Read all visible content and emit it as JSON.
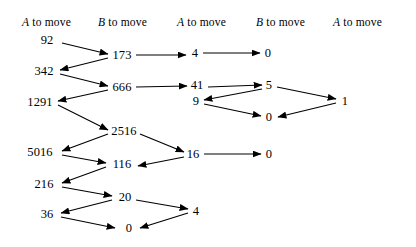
{
  "diagram": {
    "background_color": "#ffffff",
    "ink_color": "#000000",
    "columns": [
      {
        "id": "col1",
        "player": "A",
        "label": "A to move",
        "player_label": "A",
        "rest_label": " to move",
        "x": 22,
        "y": 16
      },
      {
        "id": "col2",
        "player": "B",
        "label": "B to move",
        "player_label": "B",
        "rest_label": " to move",
        "x": 98,
        "y": 16
      },
      {
        "id": "col3",
        "player": "A",
        "label": "A to move",
        "player_label": "A",
        "rest_label": " to move",
        "x": 177,
        "y": 16
      },
      {
        "id": "col4",
        "player": "B",
        "label": "B to move",
        "player_label": "B",
        "rest_label": " to move",
        "x": 256,
        "y": 16
      },
      {
        "id": "col5",
        "player": "A",
        "label": "A to move",
        "player_label": "A",
        "rest_label": " to move",
        "x": 333,
        "y": 16
      }
    ],
    "nodes": [
      {
        "id": "n92",
        "value": "92",
        "column": 1,
        "x": 47,
        "y": 40
      },
      {
        "id": "n342",
        "value": "342",
        "column": 1,
        "x": 44,
        "y": 71
      },
      {
        "id": "n1291",
        "value": "1291",
        "column": 1,
        "x": 40,
        "y": 102
      },
      {
        "id": "n5016",
        "value": "5016",
        "column": 1,
        "x": 40,
        "y": 152
      },
      {
        "id": "n216",
        "value": "216",
        "column": 1,
        "x": 44,
        "y": 184
      },
      {
        "id": "n36",
        "value": "36",
        "column": 1,
        "x": 47,
        "y": 214
      },
      {
        "id": "n173",
        "value": "173",
        "column": 2,
        "x": 122,
        "y": 55
      },
      {
        "id": "n666",
        "value": "666",
        "column": 2,
        "x": 122,
        "y": 87
      },
      {
        "id": "n2516",
        "value": "2516",
        "column": 2,
        "x": 124,
        "y": 131
      },
      {
        "id": "n116",
        "value": "116",
        "column": 2,
        "x": 122,
        "y": 164
      },
      {
        "id": "n20",
        "value": "20",
        "column": 2,
        "x": 125,
        "y": 197
      },
      {
        "id": "n0b",
        "value": "0",
        "column": 2,
        "x": 129,
        "y": 228
      },
      {
        "id": "n4a",
        "value": "4",
        "column": 3,
        "x": 195,
        "y": 53
      },
      {
        "id": "n41",
        "value": "41",
        "column": 3,
        "x": 197,
        "y": 85
      },
      {
        "id": "n9",
        "value": "9",
        "column": 3,
        "x": 196,
        "y": 101
      },
      {
        "id": "n16",
        "value": "16",
        "column": 3,
        "x": 193,
        "y": 154
      },
      {
        "id": "n4b",
        "value": "4",
        "column": 3,
        "x": 196,
        "y": 211
      },
      {
        "id": "n0c",
        "value": "0",
        "column": 4,
        "x": 268,
        "y": 53
      },
      {
        "id": "n5",
        "value": "5",
        "column": 4,
        "x": 269,
        "y": 85
      },
      {
        "id": "n0d",
        "value": "0",
        "column": 4,
        "x": 269,
        "y": 117
      },
      {
        "id": "n0e",
        "value": "0",
        "column": 4,
        "x": 269,
        "y": 154
      },
      {
        "id": "n1",
        "value": "1",
        "column": 5,
        "x": 345,
        "y": 101
      }
    ],
    "edges": [
      {
        "from": "92",
        "to": "173",
        "x1": 62,
        "y1": 43,
        "x2": 108,
        "y2": 54
      },
      {
        "from": "173",
        "to": "342",
        "x1": 108,
        "y1": 58,
        "x2": 60,
        "y2": 70
      },
      {
        "from": "342",
        "to": "666",
        "x1": 60,
        "y1": 74,
        "x2": 108,
        "y2": 86
      },
      {
        "from": "666",
        "to": "1291",
        "x1": 108,
        "y1": 90,
        "x2": 58,
        "y2": 101
      },
      {
        "from": "1291",
        "to": "2516",
        "x1": 58,
        "y1": 105,
        "x2": 108,
        "y2": 130
      },
      {
        "from": "2516",
        "to": "5016",
        "x1": 108,
        "y1": 134,
        "x2": 62,
        "y2": 151
      },
      {
        "from": "5016",
        "to": "116",
        "x1": 62,
        "y1": 155,
        "x2": 106,
        "y2": 163
      },
      {
        "from": "116",
        "to": "216",
        "x1": 106,
        "y1": 167,
        "x2": 62,
        "y2": 183
      },
      {
        "from": "216",
        "to": "20",
        "x1": 62,
        "y1": 187,
        "x2": 112,
        "y2": 196
      },
      {
        "from": "20",
        "to": "36",
        "x1": 112,
        "y1": 200,
        "x2": 61,
        "y2": 213
      },
      {
        "from": "36",
        "to": "0b",
        "x1": 61,
        "y1": 217,
        "x2": 115,
        "y2": 228
      },
      {
        "from": "173",
        "to": "4a",
        "x1": 136,
        "y1": 55,
        "x2": 186,
        "y2": 55
      },
      {
        "from": "4a",
        "to": "0c",
        "x1": 203,
        "y1": 53,
        "x2": 260,
        "y2": 53
      },
      {
        "from": "666",
        "to": "41",
        "x1": 136,
        "y1": 87,
        "x2": 187,
        "y2": 86
      },
      {
        "from": "41",
        "to": "5",
        "x1": 208,
        "y1": 87,
        "x2": 262,
        "y2": 85
      },
      {
        "from": "5",
        "to": "9",
        "x1": 262,
        "y1": 89,
        "x2": 204,
        "y2": 100
      },
      {
        "from": "9",
        "to": "0d",
        "x1": 204,
        "y1": 104,
        "x2": 261,
        "y2": 116
      },
      {
        "from": "5",
        "to": "1",
        "x1": 277,
        "y1": 87,
        "x2": 336,
        "y2": 99
      },
      {
        "from": "1",
        "to": "0d",
        "x1": 336,
        "y1": 103,
        "x2": 278,
        "y2": 117
      },
      {
        "from": "2516",
        "to": "16",
        "x1": 140,
        "y1": 134,
        "x2": 184,
        "y2": 152
      },
      {
        "from": "16",
        "to": "116",
        "x1": 184,
        "y1": 157,
        "x2": 138,
        "y2": 166
      },
      {
        "from": "16",
        "to": "0e",
        "x1": 204,
        "y1": 154,
        "x2": 261,
        "y2": 154
      },
      {
        "from": "20",
        "to": "4b",
        "x1": 136,
        "y1": 200,
        "x2": 188,
        "y2": 209
      },
      {
        "from": "4b",
        "to": "0b",
        "x1": 188,
        "y1": 213,
        "x2": 140,
        "y2": 228
      }
    ]
  }
}
